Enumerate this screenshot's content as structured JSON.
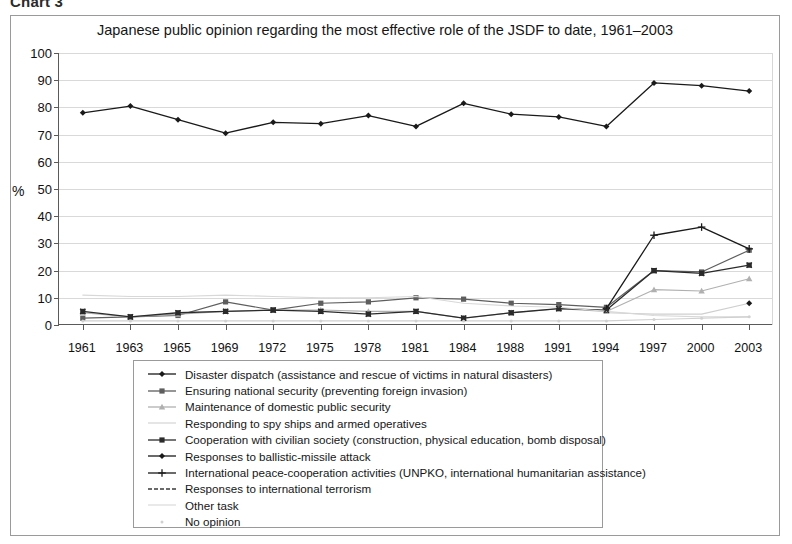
{
  "figure": {
    "caption": "Chart 3",
    "title": "Japanese public opinion regarding the most effective role of the JSDF to date, 1961–2003"
  },
  "axes": {
    "y_title": "%",
    "y_ticks": [
      "100",
      "90",
      "80",
      "70",
      "60",
      "50",
      "40",
      "30",
      "20",
      "10",
      "0"
    ],
    "x_ticks": [
      "1961",
      "1963",
      "1965",
      "1969",
      "1972",
      "1975",
      "1978",
      "1981",
      "1984",
      "1988",
      "1991",
      "1994",
      "1997",
      "2000",
      "2003"
    ]
  },
  "colors": {
    "ink": "#1a1a1a",
    "grid": "#d9d9d9",
    "axis": "#5a5a5a",
    "mid_grey": "#8a8a8a",
    "light_grey": "#bdbdbd",
    "pale_grey": "#d8d8d8"
  },
  "legend": {
    "items": [
      {
        "label": "Disaster dispatch (assistance and rescue of victims in natural disasters)",
        "marker": "diamond",
        "color": "#1a1a1a"
      },
      {
        "label": "Ensuring national security (preventing foreign invasion)",
        "marker": "square",
        "color": "#5e5e5e"
      },
      {
        "label": "Maintenance of domestic public security",
        "marker": "triangle",
        "color": "#b0b0b0"
      },
      {
        "label": "Responding to spy ships and armed operatives",
        "marker": "line",
        "color": "#cfcfcf"
      },
      {
        "label": "Cooperation with civilian society (construction, physical education, bomb disposal)",
        "marker": "square-dark",
        "color": "#2b2b2b"
      },
      {
        "label": "Responses to ballistic-missile attack",
        "marker": "diamond",
        "color": "#1a1a1a"
      },
      {
        "label": "International peace-cooperation activities (UNPKO, international humanitarian assistance)",
        "marker": "plus",
        "color": "#1a1a1a"
      },
      {
        "label": "Responses to international terrorism",
        "marker": "dash",
        "color": "#3a3a3a"
      },
      {
        "label": "Other  task",
        "marker": "line-faint",
        "color": "#d8d8d8"
      },
      {
        "label": "No opinion",
        "marker": "dot-faint",
        "color": "#d0d0d0"
      }
    ]
  },
  "chart_data": {
    "type": "line",
    "title": "Japanese public opinion regarding the most effective role of the JSDF to date, 1961–2003",
    "xlabel": "",
    "ylabel": "%",
    "ylim": [
      0,
      100
    ],
    "ytick_step": 10,
    "grid": true,
    "legend_position": "bottom",
    "categories": [
      "1961",
      "1963",
      "1965",
      "1969",
      "1972",
      "1975",
      "1978",
      "1981",
      "1984",
      "1988",
      "1991",
      "1994",
      "1997",
      "2000",
      "2003"
    ],
    "series": [
      {
        "name": "Disaster dispatch (assistance and rescue of victims in natural disasters)",
        "marker": "diamond",
        "color": "#1a1a1a",
        "width": 1.3,
        "values": [
          78,
          80.5,
          75.5,
          70.5,
          74.5,
          74,
          77,
          73,
          81.5,
          77.5,
          76.5,
          73,
          89,
          88,
          86
        ]
      },
      {
        "name": "Ensuring national security (preventing foreign invasion)",
        "marker": "square",
        "color": "#5e5e5e",
        "width": 1.2,
        "values": [
          2.5,
          3,
          3.5,
          8.5,
          5.5,
          8,
          8.5,
          10,
          9.5,
          8,
          7.5,
          6.5,
          20,
          19.5,
          27.5
        ]
      },
      {
        "name": "Maintenance of domestic public security",
        "marker": "triangle",
        "color": "#b0b0b0",
        "width": 1.1,
        "values": [
          4.5,
          3,
          4,
          5,
          5.5,
          5.5,
          5,
          5,
          2.5,
          4.5,
          6,
          5,
          13,
          12.5,
          17
        ]
      },
      {
        "name": "Responding to spy ships and armed operatives",
        "marker": "none",
        "color": "#cfcfcf",
        "width": 1.1,
        "values": [
          null,
          null,
          null,
          null,
          null,
          null,
          null,
          null,
          null,
          null,
          null,
          4.5,
          4,
          4,
          8
        ]
      },
      {
        "name": "Cooperation with civilian society (construction, physical education, bomb disposal)",
        "marker": "square-dark",
        "color": "#2b2b2b",
        "width": 1.3,
        "values": [
          5,
          3,
          4.5,
          5,
          5.5,
          5,
          4,
          5,
          2.5,
          4.5,
          6,
          5.5,
          20,
          19,
          22
        ]
      },
      {
        "name": "Responses to ballistic-missile attack",
        "marker": "diamond",
        "color": "#1a1a1a",
        "width": 1.2,
        "values": [
          null,
          null,
          null,
          null,
          null,
          null,
          null,
          null,
          null,
          null,
          null,
          null,
          null,
          null,
          8
        ]
      },
      {
        "name": "International peace-cooperation activities (UNPKO, international humanitarian assistance)",
        "marker": "plus",
        "color": "#1a1a1a",
        "width": 1.3,
        "values": [
          null,
          null,
          null,
          null,
          null,
          null,
          null,
          null,
          null,
          null,
          null,
          6,
          33,
          36,
          28
        ]
      },
      {
        "name": "Responses to international terrorism",
        "marker": "none",
        "color": "#3a3a3a",
        "width": 1.1,
        "values": [
          null,
          null,
          null,
          null,
          null,
          null,
          null,
          null,
          null,
          null,
          null,
          null,
          null,
          null,
          27.5
        ]
      },
      {
        "name": "Other  task",
        "marker": "none",
        "color": "#d8d8d8",
        "width": 1.1,
        "values": [
          11,
          10.5,
          10.5,
          11,
          10.5,
          10,
          10,
          10.5,
          8,
          7,
          6.5,
          5,
          3.5,
          3,
          3
        ]
      },
      {
        "name": "No opinion",
        "marker": "dot-faint",
        "color": "#d0d0d0",
        "width": 1.1,
        "values": [
          1.5,
          1.5,
          1.5,
          1.5,
          1.5,
          1.5,
          1.5,
          1.5,
          1.5,
          1.5,
          1.5,
          1.5,
          2,
          2.5,
          3
        ]
      }
    ]
  }
}
